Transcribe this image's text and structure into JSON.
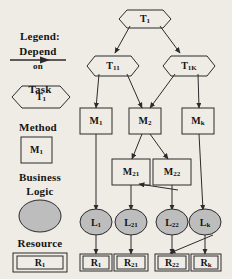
{
  "figure": {
    "background_color": "#efece6",
    "stroke_color": "#2b2b2b",
    "fill_node_color": "#bdbdbd"
  },
  "legend": {
    "heading": "Legend:",
    "items": [
      {
        "id": "depend",
        "label_line1": "Depend",
        "label_line2": "on",
        "shape": "arrow"
      },
      {
        "id": "task",
        "label": "Task",
        "sample_text": "T1",
        "sample_main": "T",
        "sample_sub": "1",
        "shape": "hexagon"
      },
      {
        "id": "method",
        "label": "Method",
        "sample_text": "M1",
        "sample_main": "M",
        "sample_sub": "1",
        "shape": "rectangle"
      },
      {
        "id": "business-logic",
        "label_line1": "Business",
        "label_line2": "Logic",
        "shape": "ellipse"
      },
      {
        "id": "resource",
        "label": "Resource",
        "sample_text": "R1",
        "sample_main": "R",
        "sample_sub": "1",
        "shape": "double-rectangle"
      }
    ]
  },
  "graph": {
    "tasks": [
      {
        "id": "T1",
        "main": "T",
        "sub": "1",
        "x": 145,
        "y": 19
      },
      {
        "id": "T11",
        "main": "T",
        "sub": "11",
        "x": 113,
        "y": 66
      },
      {
        "id": "T1K",
        "main": "T",
        "sub": "1K",
        "x": 189,
        "y": 66
      }
    ],
    "methods": [
      {
        "id": "M1",
        "main": "M",
        "sub": "1",
        "x": 96,
        "y": 121
      },
      {
        "id": "M2",
        "main": "M",
        "sub": "2",
        "x": 145,
        "y": 121
      },
      {
        "id": "Mk",
        "main": "M",
        "sub": "k",
        "x": 197,
        "y": 121
      },
      {
        "id": "M21",
        "main": "M",
        "sub": "21",
        "x": 131,
        "y": 172
      },
      {
        "id": "M22",
        "main": "M",
        "sub": "22",
        "x": 172,
        "y": 172
      }
    ],
    "logic": [
      {
        "id": "L1",
        "main": "L",
        "sub": "1",
        "x": 96,
        "y": 222
      },
      {
        "id": "L21",
        "main": "L",
        "sub": "21",
        "x": 131,
        "y": 222
      },
      {
        "id": "L22",
        "main": "L",
        "sub": "22",
        "x": 172,
        "y": 222
      },
      {
        "id": "Lk",
        "main": "L",
        "sub": "k",
        "x": 205,
        "y": 222
      }
    ],
    "resources": [
      {
        "id": "R1",
        "main": "R",
        "sub": "1",
        "x": 96,
        "y": 263
      },
      {
        "id": "R21",
        "main": "R",
        "sub": "21",
        "x": 131,
        "y": 263
      },
      {
        "id": "R22",
        "main": "R",
        "sub": "22",
        "x": 172,
        "y": 263
      },
      {
        "id": "Rk",
        "main": "R",
        "sub": "k",
        "x": 205,
        "y": 263
      }
    ],
    "edges": [
      {
        "from": "T1",
        "to": "T11"
      },
      {
        "from": "T1",
        "to": "T1K"
      },
      {
        "from": "T11",
        "to": "M1"
      },
      {
        "from": "T11",
        "to": "M2"
      },
      {
        "from": "T1K",
        "to": "M2"
      },
      {
        "from": "T1K",
        "to": "Mk"
      },
      {
        "from": "M2",
        "to": "M21"
      },
      {
        "from": "M2",
        "to": "M22"
      },
      {
        "from": "M1",
        "to": "L1"
      },
      {
        "from": "M21",
        "to": "L21"
      },
      {
        "from": "M22",
        "to": "L22"
      },
      {
        "from": "Mk",
        "to": "Lk"
      },
      {
        "from": "M22",
        "to": "L21",
        "style": "cross"
      },
      {
        "from": "L1",
        "to": "R1"
      },
      {
        "from": "L21",
        "to": "R21"
      },
      {
        "from": "L22",
        "to": "R22"
      },
      {
        "from": "Lk",
        "to": "Rk"
      },
      {
        "from": "Lk",
        "to": "R22",
        "style": "cross"
      }
    ]
  }
}
